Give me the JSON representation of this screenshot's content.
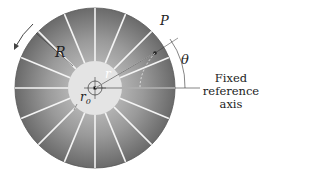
{
  "figure": {
    "labels": {
      "R": "R",
      "P": "P",
      "r": "r",
      "r0": "r",
      "r0_sub": "0",
      "theta": "θ",
      "axis_line1": "Fixed",
      "axis_line2": "reference",
      "axis_line3": "axis"
    },
    "colors": {
      "disk_dark": "#6e6e6e",
      "disk_light": "#c8c8c8",
      "hub": "#e6e6e6",
      "blade": "#f2f2f2",
      "ink": "#222222"
    },
    "geometry": {
      "center": [
        95,
        88
      ],
      "outer_radius": 80,
      "hub_radius": 27,
      "inner_circle_radius": 7,
      "blade_count": 16
    }
  }
}
